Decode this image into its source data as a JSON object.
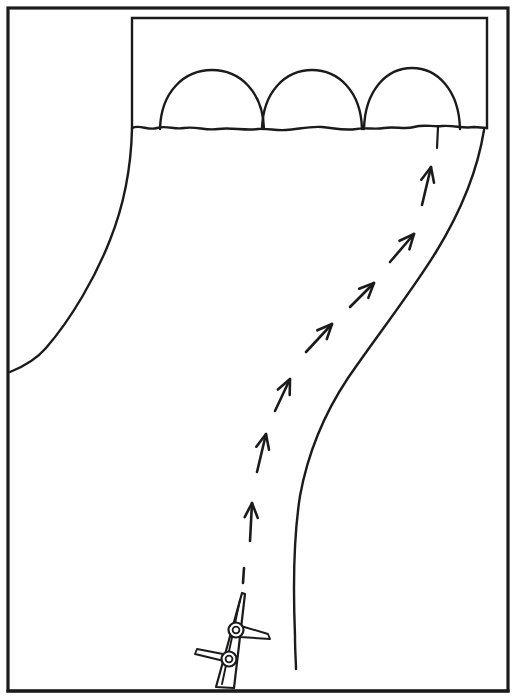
{
  "figure": {
    "title": "Line drawing: vessel trajectory toward arched bridge",
    "kind": "technical-line-drawing",
    "canvas": {
      "width": 516,
      "height": 699,
      "background": "#ffffff"
    },
    "ink_color": "#1b1b1d"
  },
  "frame": {
    "outer": {
      "x": 8,
      "y": 8,
      "width": 500,
      "height": 683,
      "stroke_width": 3.2
    },
    "inner_panel": {
      "x": 132,
      "y": 18,
      "width": 355,
      "height": 110,
      "stroke_width": 2.4
    }
  },
  "scene": {
    "horizon_label": "shoreline",
    "horizon_y": 127,
    "arches": [
      {
        "name": "arch-left",
        "center_x": 212,
        "base_y": 128,
        "rx": 52,
        "ry": 58
      },
      {
        "name": "arch-center",
        "center_x": 312,
        "base_y": 128,
        "rx": 50,
        "ry": 58
      },
      {
        "name": "arch-right",
        "center_x": 412,
        "base_y": 128,
        "rx": 48,
        "ry": 60
      }
    ],
    "marker_tick": {
      "name": "channel-marker",
      "x": 438,
      "y_top": 127,
      "y_bottom": 148
    },
    "left_bank": {
      "name": "left-bank-curve",
      "from": [
        132,
        128
      ],
      "to": [
        10,
        372
      ]
    },
    "right_bank": {
      "name": "right-bank-curve",
      "from": [
        484,
        130
      ],
      "to": [
        296,
        669
      ]
    }
  },
  "trajectory": {
    "name": "approach-path",
    "style": "dashed-arrows",
    "direction": "upstream",
    "arrow_count": 7,
    "arrows": [
      {
        "index": 1,
        "tail": [
          250,
          541
        ],
        "tip": [
          252,
          503
        ],
        "angle_deg": 87
      },
      {
        "index": 2,
        "tail": [
          257,
          472
        ],
        "tip": [
          266,
          434
        ],
        "angle_deg": 77
      },
      {
        "index": 3,
        "tail": [
          275,
          411
        ],
        "tip": [
          290,
          379
        ],
        "angle_deg": 65
      },
      {
        "index": 4,
        "tail": [
          306,
          352
        ],
        "tip": [
          332,
          324
        ],
        "angle_deg": 47
      },
      {
        "index": 5,
        "tail": [
          350,
          307
        ],
        "tip": [
          374,
          283
        ],
        "angle_deg": 45
      },
      {
        "index": 6,
        "tail": [
          390,
          262
        ],
        "tip": [
          414,
          234
        ],
        "angle_deg": 49
      },
      {
        "index": 7,
        "tail": [
          422,
          205
        ],
        "tip": [
          431,
          167
        ],
        "angle_deg": 77
      }
    ],
    "lead_dash": {
      "tail": [
        243,
        583
      ],
      "tip": [
        244,
        568
      ]
    }
  },
  "vessel": {
    "name": "mast-with-yard-arms",
    "tilt_deg": 13,
    "base": [
      222,
      688
    ],
    "tip": [
      243,
      593
    ],
    "rings": [
      {
        "index": 1,
        "center": [
          236,
          630
        ],
        "r_outer": 7.5,
        "r_inner": 3.4,
        "arm_side": "right"
      },
      {
        "index": 2,
        "center": [
          229,
          659
        ],
        "r_outer": 7.5,
        "r_inner": 3.4,
        "arm_side": "left"
      }
    ],
    "arms": [
      {
        "index": 1,
        "from": [
          243,
          629
        ],
        "to": [
          270,
          638
        ],
        "side": "right"
      },
      {
        "index": 2,
        "from": [
          221,
          658
        ],
        "to": [
          197,
          651
        ],
        "side": "left"
      }
    ]
  }
}
